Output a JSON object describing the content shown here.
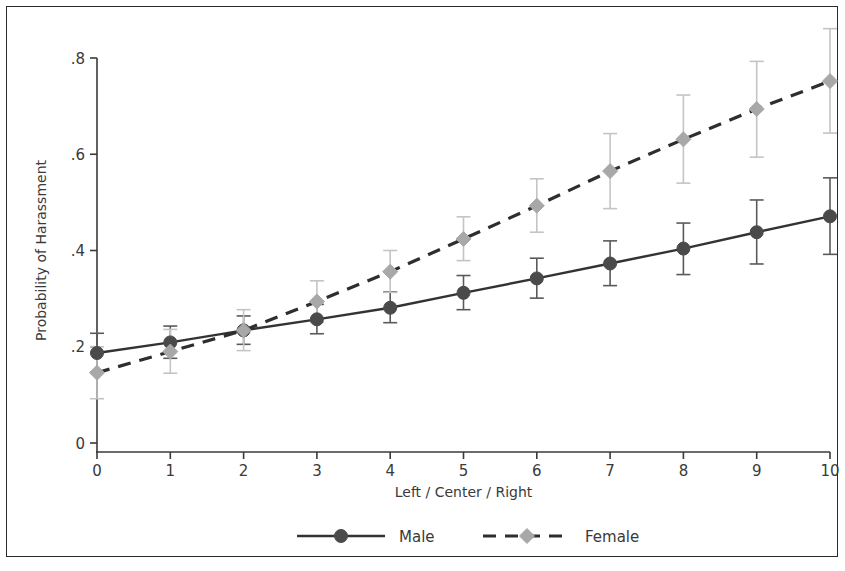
{
  "chart_data": {
    "type": "line",
    "title": "",
    "subtitle": "",
    "xlabel": "Left / Center / Right",
    "ylabel": "Probability of Harassment",
    "x": [
      0,
      1,
      2,
      3,
      4,
      5,
      6,
      7,
      8,
      9,
      10
    ],
    "xticklabels": [
      "0",
      "1",
      "2",
      "3",
      "4",
      "5",
      "6",
      "7",
      "8",
      "9",
      "10"
    ],
    "yticks": [
      0,
      0.2,
      0.4,
      0.6,
      0.8
    ],
    "yticklabels": [
      "0",
      ".2",
      ".4",
      ".6",
      ".8"
    ],
    "xlim": [
      0,
      10
    ],
    "ylim": [
      0,
      0.8
    ],
    "grid": false,
    "legend_position": "bottom-center",
    "error_bars": "95% confidence interval",
    "series": [
      {
        "name": "Male",
        "linestyle": "solid",
        "marker": "circle",
        "color": "#4a4a4a",
        "values": [
          0.187,
          0.209,
          0.234,
          0.257,
          0.281,
          0.312,
          0.342,
          0.373,
          0.404,
          0.438,
          0.471
        ],
        "ci_low": [
          0.148,
          0.176,
          0.205,
          0.227,
          0.25,
          0.277,
          0.301,
          0.327,
          0.35,
          0.372,
          0.392
        ],
        "ci_high": [
          0.228,
          0.243,
          0.264,
          0.288,
          0.314,
          0.348,
          0.384,
          0.42,
          0.457,
          0.505,
          0.551
        ]
      },
      {
        "name": "Female",
        "linestyle": "dashed",
        "marker": "diamond",
        "color": "#a8a8a8",
        "values": [
          0.146,
          0.19,
          0.234,
          0.294,
          0.356,
          0.424,
          0.493,
          0.565,
          0.631,
          0.694,
          0.752
        ],
        "ci_low": [
          0.092,
          0.145,
          0.192,
          0.251,
          0.313,
          0.379,
          0.438,
          0.487,
          0.54,
          0.594,
          0.644
        ],
        "ci_high": [
          0.2,
          0.236,
          0.277,
          0.337,
          0.4,
          0.47,
          0.549,
          0.643,
          0.723,
          0.793,
          0.861
        ]
      }
    ]
  },
  "axes": {
    "y_title": "Probability of Harassment",
    "x_title": "Left / Center / Right"
  },
  "legend": {
    "entries": [
      {
        "label": "Male"
      },
      {
        "label": "Female"
      }
    ]
  },
  "colors": {
    "male": "#4a4a4a",
    "female": "#a8a8a8",
    "axis": "#3a3a3a",
    "frame": "#2b2b2b",
    "background": "#ffffff"
  },
  "geometry": {
    "plot_left": 97,
    "plot_right": 830,
    "y_zero": 443,
    "y_top": 58,
    "y_value_top": 0.8,
    "axis_bottom": 452,
    "tick_len": 7
  }
}
